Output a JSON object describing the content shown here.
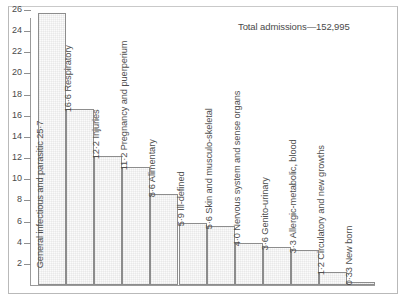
{
  "annotation": {
    "total_admissions": "Total admissions—152,995"
  },
  "axis": {
    "ticks": [
      "26",
      "24",
      "22",
      "20",
      "18",
      "16",
      "14",
      "12",
      "10",
      "8",
      "6",
      "4",
      "2"
    ]
  },
  "chart_data": {
    "type": "bar",
    "title": "",
    "subtitle": "",
    "xlabel": "",
    "ylabel": "",
    "ylim": [
      0,
      26
    ],
    "grid": false,
    "legend": "none",
    "orientation": "vertical",
    "annotations": [
      "Total admissions—152,995"
    ],
    "ytick_labels": [
      "2",
      "4",
      "6",
      "8",
      "10",
      "12",
      "14",
      "16",
      "18",
      "20",
      "22",
      "24",
      "26"
    ],
    "categories": [
      "General infectious and parasitic",
      "Respiratory",
      "Injuries",
      "Pregnancy and puerperium",
      "Alimentary",
      "Ill-defined",
      "Skin and musculo-skeletal",
      "Nervous system and sense organs",
      "Genito-urinary",
      "Allergic-metabolic, blood",
      "Circulatory and new growths",
      "New born"
    ],
    "values": [
      25.7,
      16.6,
      12.2,
      11.2,
      8.6,
      5.9,
      5.6,
      4.0,
      3.6,
      3.3,
      1.2,
      0.33
    ],
    "bars": [
      {
        "label": "General infectious and parasitic 25·7",
        "value": 25.7,
        "value_text": "25·7"
      },
      {
        "label": "16·6 Respiratory",
        "value": 16.6,
        "value_text": "16·6"
      },
      {
        "label": "12·2 Injuries",
        "value": 12.2,
        "value_text": "12·2"
      },
      {
        "label": "11·2 Pregnancy and puerperium",
        "value": 11.2,
        "value_text": "11·2"
      },
      {
        "label": "8·6 Alimentary",
        "value": 8.6,
        "value_text": "8·6"
      },
      {
        "label": "5·9 Ill-defined",
        "value": 5.9,
        "value_text": "5·9"
      },
      {
        "label": "5·6 Skin and musculo-skeletal",
        "value": 5.6,
        "value_text": "5·6"
      },
      {
        "label": "4·0 Nervous system and sense organs",
        "value": 4.0,
        "value_text": "4·0"
      },
      {
        "label": "3·6 Genito-urinary",
        "value": 3.6,
        "value_text": "3·6"
      },
      {
        "label": "3·3 Allergic-metabolic, blood",
        "value": 3.3,
        "value_text": "3·3"
      },
      {
        "label": "1·2 Circulatory and new growths",
        "value": 1.2,
        "value_text": "1·2"
      },
      {
        "label": "0·33 New born",
        "value": 0.33,
        "value_text": "0·33"
      }
    ]
  }
}
